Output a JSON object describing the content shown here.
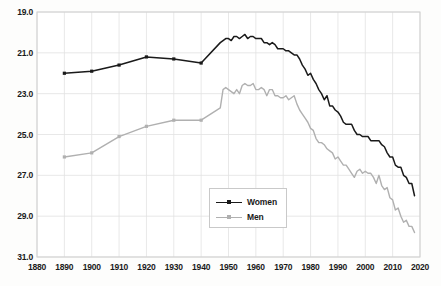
{
  "chart_data": {
    "type": "line",
    "title": "",
    "subtitle": "",
    "xlabel": "",
    "ylabel": "",
    "xlim": [
      1880,
      2020
    ],
    "ylim": [
      19.0,
      31.0
    ],
    "y_axis_inverted": true,
    "grid": true,
    "legend_position": "center",
    "x_ticks": [
      1880,
      1890,
      1900,
      1910,
      1920,
      1930,
      1940,
      1950,
      1960,
      1970,
      1980,
      1990,
      2000,
      2010,
      2020
    ],
    "x_tick_labels": [
      "1880",
      "1890",
      "1900",
      "1910",
      "1920",
      "1930",
      "1940",
      "1950",
      "1960",
      "1970",
      "1980",
      "1990",
      "2000",
      "2010",
      "2020"
    ],
    "y_ticks": [
      19.0,
      21.0,
      23.0,
      25.0,
      27.0,
      29.0,
      31.0
    ],
    "y_tick_labels": [
      "19.0",
      "21.0",
      "23.0",
      "25.0",
      "27.0",
      "29.0",
      "31.0"
    ],
    "series": [
      {
        "name": "Women",
        "color": "#1a1a1a",
        "marker": "square",
        "sparse_points": [
          {
            "x": 1890,
            "y": 22.0
          },
          {
            "x": 1900,
            "y": 21.9
          },
          {
            "x": 1910,
            "y": 21.6
          },
          {
            "x": 1920,
            "y": 21.2
          },
          {
            "x": 1930,
            "y": 21.3
          },
          {
            "x": 1940,
            "y": 21.5
          }
        ],
        "x": [
          1947,
          1948,
          1949,
          1950,
          1951,
          1952,
          1953,
          1954,
          1955,
          1956,
          1957,
          1958,
          1959,
          1960,
          1961,
          1962,
          1963,
          1964,
          1965,
          1966,
          1967,
          1968,
          1969,
          1970,
          1971,
          1972,
          1973,
          1974,
          1975,
          1976,
          1977,
          1978,
          1979,
          1980,
          1981,
          1982,
          1983,
          1984,
          1985,
          1986,
          1987,
          1988,
          1989,
          1990,
          1991,
          1992,
          1993,
          1994,
          1995,
          1996,
          1997,
          1998,
          1999,
          2000,
          2001,
          2002,
          2003,
          2004,
          2005,
          2006,
          2007,
          2008,
          2009,
          2010,
          2011,
          2012,
          2013,
          2014,
          2015,
          2016,
          2017,
          2018
        ],
        "values": [
          20.5,
          20.4,
          20.3,
          20.3,
          20.4,
          20.2,
          20.2,
          20.3,
          20.2,
          20.1,
          20.3,
          20.2,
          20.2,
          20.3,
          20.3,
          20.3,
          20.5,
          20.5,
          20.6,
          20.5,
          20.6,
          20.8,
          20.8,
          20.8,
          20.9,
          20.9,
          21.0,
          21.1,
          21.1,
          21.3,
          21.6,
          21.8,
          22.1,
          22.0,
          22.3,
          22.5,
          22.8,
          23.0,
          23.3,
          23.1,
          23.6,
          23.6,
          23.8,
          23.9,
          24.1,
          24.4,
          24.5,
          24.5,
          24.5,
          24.8,
          25.0,
          25.0,
          25.1,
          25.1,
          25.1,
          25.3,
          25.3,
          25.3,
          25.3,
          25.5,
          25.6,
          25.9,
          26.1,
          26.1,
          26.5,
          26.6,
          26.6,
          27.0,
          27.1,
          27.4,
          27.4,
          28.0
        ]
      },
      {
        "name": "Men",
        "color": "#b0b0b0",
        "marker": "square",
        "sparse_points": [
          {
            "x": 1890,
            "y": 26.1
          },
          {
            "x": 1900,
            "y": 25.9
          },
          {
            "x": 1910,
            "y": 25.1
          },
          {
            "x": 1920,
            "y": 24.6
          },
          {
            "x": 1930,
            "y": 24.3
          },
          {
            "x": 1940,
            "y": 24.3
          }
        ],
        "x": [
          1947,
          1948,
          1949,
          1950,
          1951,
          1952,
          1953,
          1954,
          1955,
          1956,
          1957,
          1958,
          1959,
          1960,
          1961,
          1962,
          1963,
          1964,
          1965,
          1966,
          1967,
          1968,
          1969,
          1970,
          1971,
          1972,
          1973,
          1974,
          1975,
          1976,
          1977,
          1978,
          1979,
          1980,
          1981,
          1982,
          1983,
          1984,
          1985,
          1986,
          1987,
          1988,
          1989,
          1990,
          1991,
          1992,
          1993,
          1994,
          1995,
          1996,
          1997,
          1998,
          1999,
          2000,
          2001,
          2002,
          2003,
          2004,
          2005,
          2006,
          2007,
          2008,
          2009,
          2010,
          2011,
          2012,
          2013,
          2014,
          2015,
          2016,
          2017,
          2018
        ],
        "values": [
          23.7,
          22.8,
          22.7,
          22.8,
          22.9,
          23.0,
          22.8,
          23.0,
          22.6,
          22.5,
          22.6,
          22.6,
          22.5,
          22.8,
          22.8,
          22.7,
          22.8,
          23.1,
          22.8,
          22.8,
          23.1,
          23.1,
          23.2,
          23.2,
          23.1,
          23.3,
          23.2,
          23.1,
          23.5,
          23.8,
          24.0,
          24.2,
          24.4,
          24.7,
          24.8,
          25.2,
          25.4,
          25.4,
          25.5,
          25.7,
          25.8,
          25.9,
          26.2,
          26.1,
          26.3,
          26.5,
          26.5,
          26.7,
          26.9,
          27.1,
          26.8,
          26.7,
          26.9,
          26.8,
          26.9,
          26.9,
          27.1,
          27.4,
          27.0,
          27.5,
          27.7,
          27.6,
          28.1,
          28.2,
          28.7,
          28.6,
          29.0,
          29.3,
          29.2,
          29.5,
          29.5,
          29.8
        ]
      }
    ]
  },
  "legend": {
    "entries": [
      {
        "label": "Women"
      },
      {
        "label": "Men"
      }
    ]
  },
  "colors": {
    "women": "#1a1a1a",
    "men": "#b0b0b0",
    "grid": "#e2e2e2",
    "frame": "#cfcfcf",
    "background": "#fdfdfc",
    "text": "#1a1a1a"
  }
}
